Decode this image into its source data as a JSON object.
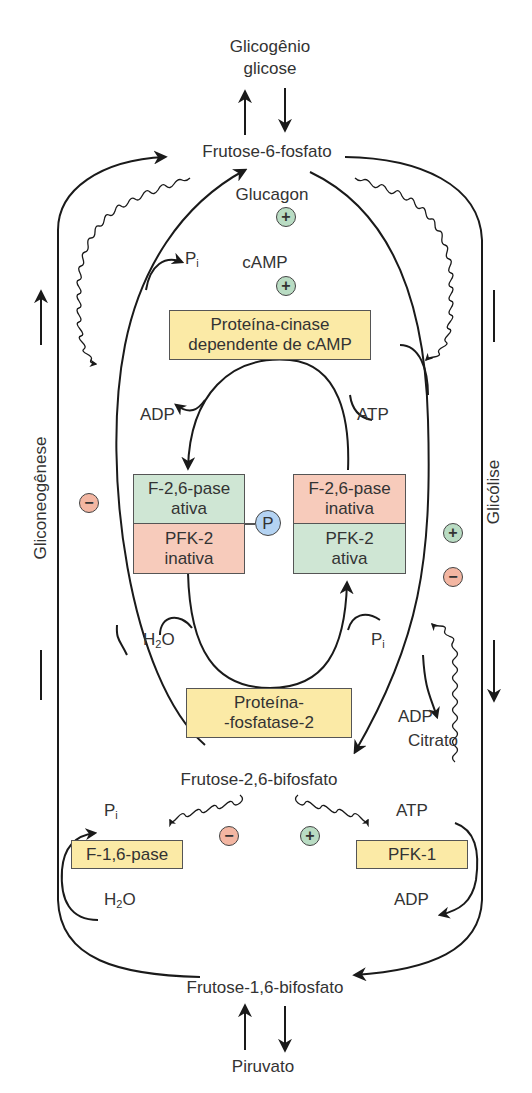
{
  "diagram": {
    "type": "metabolic-regulation-pathway",
    "metabolites": {
      "glycogen": "Glicogênio",
      "glucose": "glicose",
      "f6p": "Frutose-6-fosfato",
      "f26bp": "Frutose-2,6-bifosfato",
      "f16bp": "Frutose-1,6-bifosfato",
      "pyruvate": "Piruvato",
      "glucagon": "Glucagon",
      "camp": "cAMP",
      "citrate": "Citrato"
    },
    "enzymes": {
      "pka_line1": "Proteína-cinase",
      "pka_line2": "dependente de cAMP",
      "pp2_line1": "Proteína-",
      "pp2_line2": "-fosfatase-2",
      "f16pase": "F-1,6-pase",
      "pfk1": "PFK-1"
    },
    "bifunctional_left": {
      "top_line1": "F-2,6-pase",
      "top_line2": "ativa",
      "bottom_line1": "PFK-2",
      "bottom_line2": "inativa"
    },
    "bifunctional_right": {
      "top_line1": "F-2,6-pase",
      "top_line2": "inativa",
      "bottom_line1": "PFK-2",
      "bottom_line2": "ativa"
    },
    "phospho_badge": "P",
    "cofactors": {
      "adp_upper_left": "ADP",
      "atp_upper_right": "ATP",
      "pi_top_left": "P",
      "pi_top_left_sub": "i",
      "h2o_mid_left_pre": "H",
      "h2o_mid_left_sub": "2",
      "h2o_mid_left_post": "O",
      "pi_mid_right": "P",
      "pi_mid_right_sub": "i",
      "adp_mid_right": "ADP",
      "pi_lower_left": "P",
      "pi_lower_left_sub": "i",
      "h2o_lower_left_pre": "H",
      "h2o_lower_left_sub": "2",
      "h2o_lower_left_post": "O",
      "atp_lower_right": "ATP",
      "adp_lower_right": "ADP"
    },
    "pathways": {
      "left": "Gliconeogênese",
      "right": "Glicólise"
    },
    "effector_symbols": {
      "plus": "+",
      "minus": "−"
    },
    "colors": {
      "yellow_box": "#fbeaa6",
      "green_box": "#cfe6d4",
      "pink_box": "#f7cbbb",
      "plus_badge": "#b9dcc3",
      "minus_badge": "#f3b6a2",
      "phospho_badge": "#b4d3f2",
      "line": "#1a1a1a"
    }
  }
}
